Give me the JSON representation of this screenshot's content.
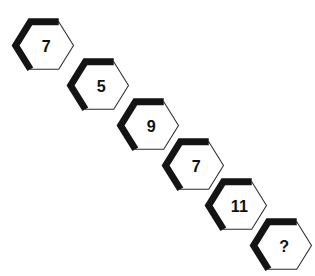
{
  "diagram": {
    "type": "hexagon-number-sequence",
    "background_color": "#ffffff",
    "hexagon": {
      "fill_color": "#ffffff",
      "thick_edge_color": "#141414",
      "thin_edge_color": "#2b2b2b",
      "label_color": "#111111",
      "orientation": "pointy-left-right",
      "width": 61,
      "height": 50
    },
    "layout": {
      "direction": "diagonal-down-right",
      "step_x": 55,
      "step_y": 40,
      "count": 6
    },
    "cells": [
      {
        "label": "7",
        "x": 12,
        "y": 17,
        "name": "hexagon-1"
      },
      {
        "label": "5",
        "x": 67,
        "y": 57,
        "name": "hexagon-2"
      },
      {
        "label": "9",
        "x": 117,
        "y": 97,
        "name": "hexagon-3"
      },
      {
        "label": "7",
        "x": 162,
        "y": 137,
        "name": "hexagon-4"
      },
      {
        "label": "11",
        "x": 205,
        "y": 177,
        "name": "hexagon-5"
      },
      {
        "label": "?",
        "x": 250,
        "y": 217,
        "name": "hexagon-6-unknown"
      }
    ],
    "sequence_values": [
      "7",
      "5",
      "9",
      "7",
      "11",
      "?"
    ]
  }
}
